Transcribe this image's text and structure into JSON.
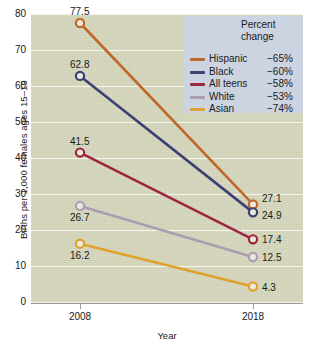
{
  "chart_data": {
    "type": "line",
    "title": "",
    "xlabel": "Year",
    "ylabel": "Births per 1,000 females ages 15–19",
    "categories": [
      "2008",
      "2018"
    ],
    "x": [
      2008,
      2018
    ],
    "xlim": [
      2008,
      2018
    ],
    "ylim": [
      0,
      80
    ],
    "yticks": [
      "0",
      "10",
      "20",
      "30",
      "40",
      "50",
      "60",
      "70",
      "80"
    ],
    "grid": true,
    "legend_position": "top-right",
    "legend_header_line1": "Percent",
    "legend_header_line2": "change",
    "series": [
      {
        "name": "Hispanic",
        "values": [
          77.5,
          27.1
        ],
        "labels": [
          "77.5",
          "27.1"
        ],
        "percent_change": "−65%",
        "color": "#c0682a"
      },
      {
        "name": "Black",
        "values": [
          62.8,
          24.9
        ],
        "labels": [
          "62.8",
          "24.9"
        ],
        "percent_change": "−60%",
        "color": "#3b4173"
      },
      {
        "name": "All teens",
        "values": [
          41.5,
          17.4
        ],
        "labels": [
          "41.5",
          "17.4"
        ],
        "percent_change": "−58%",
        "color": "#9e2740"
      },
      {
        "name": "White",
        "values": [
          26.7,
          12.5
        ],
        "labels": [
          "26.7",
          "12.5"
        ],
        "percent_change": "−53%",
        "color": "#ad9db2"
      },
      {
        "name": "Asian",
        "values": [
          16.2,
          4.3
        ],
        "labels": [
          "16.2",
          "4.3"
        ],
        "percent_change": "−74%",
        "color": "#e2a02e"
      }
    ],
    "colors": {
      "plot_background": "#d5d6bc",
      "gridline": "#f3f3ea",
      "legend_background": "#ccd4e2",
      "axis": "#9b9b93",
      "text": "#1a1a1a",
      "marker_fill": "#eceadd"
    }
  }
}
